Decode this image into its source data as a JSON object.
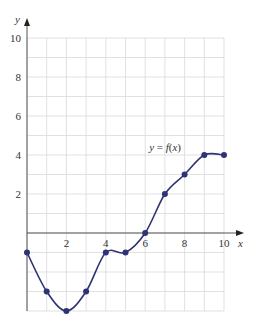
{
  "chart_data": {
    "type": "line",
    "title": "",
    "xlabel": "x",
    "ylabel": "y",
    "curve_label": "y = f(x)",
    "xlim": [
      0,
      10
    ],
    "ylim": [
      -4,
      10
    ],
    "grid": true,
    "grid_step": 1,
    "x_ticks": [
      2,
      4,
      6,
      8,
      10
    ],
    "y_ticks": [
      2,
      4,
      6,
      8,
      10
    ],
    "series": [
      {
        "name": "y = f(x)",
        "x": [
          0,
          1,
          2,
          3,
          4,
          5,
          6,
          7,
          8,
          9,
          10
        ],
        "values": [
          -1,
          -3,
          -4,
          -3,
          -1,
          -1,
          0,
          2,
          3,
          4,
          4
        ]
      }
    ],
    "colors": {
      "curve": "#2e3473",
      "grid": "#d9d9d9",
      "axis": "#555555"
    }
  }
}
